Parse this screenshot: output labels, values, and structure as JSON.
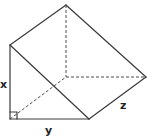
{
  "diagram": {
    "type": "triangular-prism",
    "labels": {
      "x": "x",
      "y": "y",
      "z": "z"
    },
    "right_angle_marker": true,
    "colors": {
      "edge": "#3a3a3a",
      "hidden_edge": "#4a4a4a",
      "label": "#222222",
      "background": "#ffffff"
    },
    "vertices": {
      "front_top": [
        10,
        45
      ],
      "front_bottom_left": [
        10,
        119
      ],
      "front_bottom_right": [
        89,
        119
      ],
      "back_top": [
        66,
        5
      ],
      "back_bottom_left": [
        66,
        77
      ],
      "back_bottom_right": [
        146,
        77
      ]
    }
  }
}
